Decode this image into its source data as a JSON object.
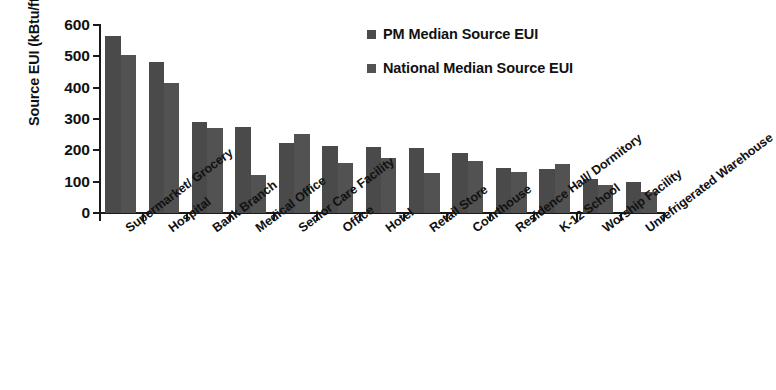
{
  "chart_data": {
    "type": "bar",
    "title": "",
    "xlabel": "",
    "ylabel": "Source EUI (kBtu/ft²)",
    "ylabel_main": "Source EUI (kBtu/ft",
    "ylabel_sup": "2",
    "ylabel_tail": ")",
    "ylim": [
      0,
      600
    ],
    "ytick_step": 100,
    "yticks": [
      "600",
      "500",
      "400",
      "300",
      "200",
      "100",
      "0"
    ],
    "ytick_values": [
      600,
      500,
      400,
      300,
      200,
      100,
      0
    ],
    "grid": false,
    "legend_position": "top-right",
    "categories": [
      "Supermarket/ Grocery",
      "Hospital",
      "Bank Branch",
      "Medical Office",
      "Senior Care Facility",
      "Office",
      "Hotel",
      "Retail Store",
      "Courthouse",
      "Residence Hall/ Dormitory",
      "K-12 School",
      "Worship Facility",
      "Unrefrigerated Warehouse"
    ],
    "series": [
      {
        "name": "PM Median Source EUI",
        "color": "#4a4a4a",
        "values": [
          565,
          483,
          292,
          275,
          225,
          213,
          212,
          208,
          190,
          145,
          140,
          108,
          100
        ]
      },
      {
        "name": "National Median Source EUI",
        "color": "#525252",
        "values": [
          505,
          415,
          270,
          122,
          252,
          160,
          175,
          128,
          165,
          132,
          155,
          88,
          68
        ]
      }
    ]
  },
  "legend": {
    "items": [
      {
        "label": "PM Median Source EUI",
        "color": "#4a4a4a"
      },
      {
        "label": "National Median Source EUI",
        "color": "#525252"
      }
    ]
  }
}
